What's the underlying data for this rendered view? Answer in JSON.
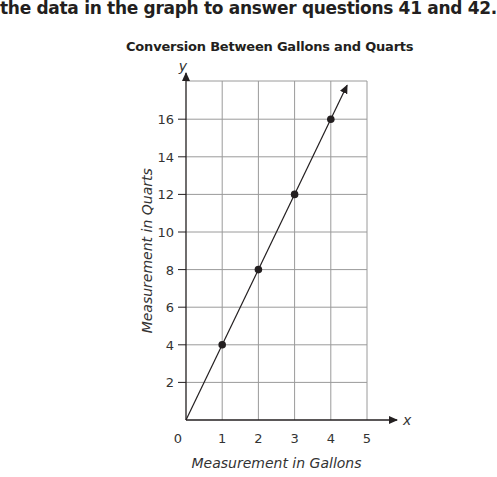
{
  "instruction": "the data in the graph to answer questions 41 and 42.",
  "chart_data": {
    "type": "line",
    "title": "Conversion Between Gallons and Quarts",
    "xlabel": "Measurement in Gallons",
    "ylabel": "Measurement in Quarts",
    "x_axis_name": "x",
    "y_axis_name": "y",
    "origin_label": "0",
    "xlim": [
      0,
      5
    ],
    "ylim": [
      0,
      18
    ],
    "x_ticks": [
      1,
      2,
      3,
      4,
      5
    ],
    "y_ticks": [
      2,
      4,
      6,
      8,
      10,
      12,
      14,
      16
    ],
    "grid": true,
    "series": [
      {
        "name": "Quarts vs Gallons",
        "x": [
          0,
          1,
          2,
          3,
          4
        ],
        "y": [
          0,
          4,
          8,
          12,
          16
        ],
        "markers_at": [
          1,
          2,
          3,
          4
        ],
        "extends_with_arrow": true
      }
    ]
  }
}
